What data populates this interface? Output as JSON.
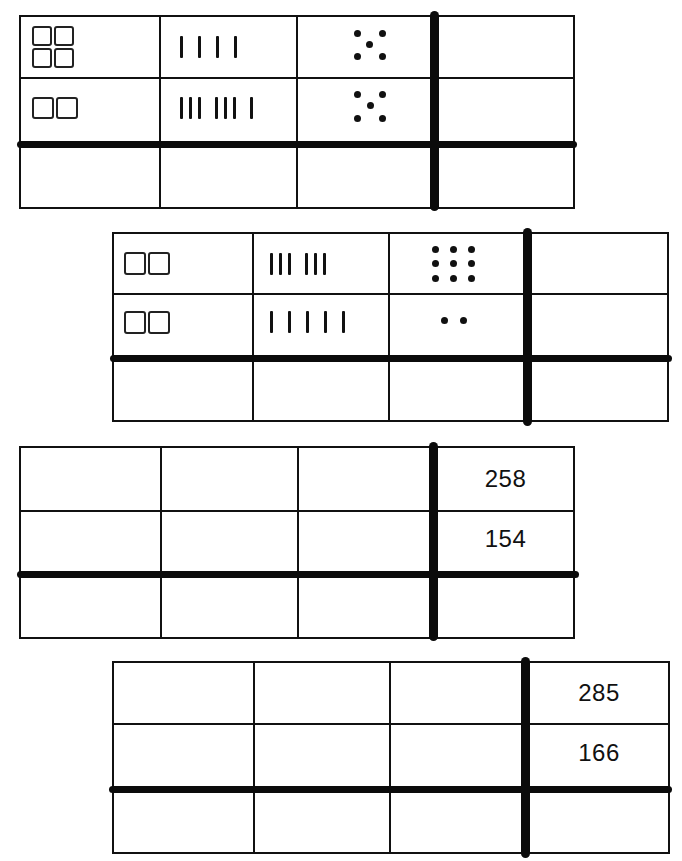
{
  "worksheet": {
    "tables": [
      {
        "rows": [
          {
            "hundreds": 4,
            "tens": 4,
            "ones": 5,
            "tens_grouping": [
              4
            ],
            "answer": ""
          },
          {
            "hundreds": 2,
            "tens": 7,
            "ones": 5,
            "tens_grouping": [
              3,
              3,
              1
            ],
            "answer": ""
          },
          {
            "hundreds": "",
            "tens": "",
            "ones": "",
            "answer": ""
          }
        ]
      },
      {
        "rows": [
          {
            "hundreds": 2,
            "tens": 6,
            "ones": 9,
            "tens_grouping": [
              3,
              3
            ],
            "answer": ""
          },
          {
            "hundreds": 2,
            "tens": 5,
            "ones": 2,
            "tens_grouping": [
              5
            ],
            "answer": ""
          },
          {
            "hundreds": "",
            "tens": "",
            "ones": "",
            "answer": ""
          }
        ]
      },
      {
        "rows": [
          {
            "hundreds": "",
            "tens": "",
            "ones": "",
            "answer": "258"
          },
          {
            "hundreds": "",
            "tens": "",
            "ones": "",
            "answer": "154"
          },
          {
            "hundreds": "",
            "tens": "",
            "ones": "",
            "answer": ""
          }
        ]
      },
      {
        "rows": [
          {
            "hundreds": "",
            "tens": "",
            "ones": "",
            "answer": "285"
          },
          {
            "hundreds": "",
            "tens": "",
            "ones": "",
            "answer": "166"
          },
          {
            "hundreds": "",
            "tens": "",
            "ones": "",
            "answer": ""
          }
        ]
      }
    ],
    "icons": {
      "hundreds": "hundred-square-icon",
      "tens": "tally-mark-icon",
      "ones": "unit-dot-icon"
    }
  }
}
